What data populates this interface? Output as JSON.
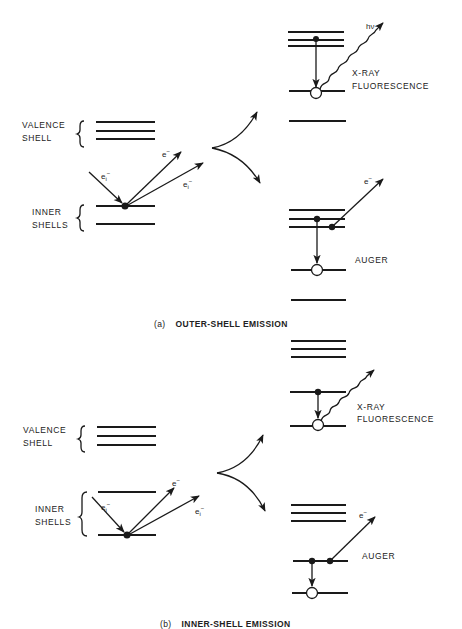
{
  "panels": [
    {
      "id": "a",
      "caption_letter": "(a)",
      "caption_title": "OUTER-SHELL EMISSION",
      "left_labels": {
        "valence_1": "VALENCE",
        "valence_2": "SHELL",
        "inner_1": "INNER",
        "inner_2": "SHELLS"
      },
      "electron_labels": {
        "incident": "e",
        "incident_sub": "i",
        "incident_sup": "−",
        "ejected": "e",
        "ejected_sup": "−",
        "scattered": "e",
        "scattered_sub": "i",
        "scattered_sup": "−"
      },
      "processes": {
        "fluorescence_1": "X-RAY",
        "fluorescence_2": "FLUORESCENCE",
        "photon": "hν",
        "auger": "AUGER",
        "auger_electron": "e",
        "auger_electron_sup": "−"
      }
    },
    {
      "id": "b",
      "caption_letter": "(b)",
      "caption_title": "INNER-SHELL EMISSION",
      "left_labels": {
        "valence_1": "VALENCE",
        "valence_2": "SHELL",
        "inner_1": "INNER",
        "inner_2": "SHELLS"
      },
      "electron_labels": {
        "incident": "e",
        "incident_sub": "i",
        "incident_sup": "−",
        "ejected": "e",
        "ejected_sup": "−",
        "scattered": "e",
        "scattered_sub": "i",
        "scattered_sup": "−"
      },
      "processes": {
        "fluorescence_1": "X-RAY",
        "fluorescence_2": "FLUORESCENCE",
        "auger": "AUGER",
        "auger_electron": "e",
        "auger_electron_sup": "−"
      }
    }
  ],
  "colors": {
    "ink": "#1a1a1a",
    "background": "#ffffff"
  }
}
